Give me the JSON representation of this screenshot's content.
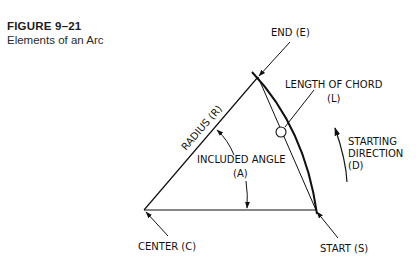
{
  "caption": {
    "figure_number": "FIGURE 9–21",
    "title": "Elements of an Arc"
  },
  "diagram": {
    "labels": {
      "end": "END (E)",
      "length_chord_1": "LENGTH OF CHORD",
      "length_chord_2": "(L)",
      "radius": "RADIUS (R)",
      "included_angle_1": "INCLUDED ANGLE",
      "included_angle_2": "(A)",
      "starting_dir_1": "STARTING",
      "starting_dir_2": "DIRECTION",
      "starting_dir_3": "(D)",
      "center": "CENTER (C)",
      "start": "START (S)"
    },
    "points": {
      "center": [
        144,
        210
      ],
      "end": [
        258,
        77
      ],
      "start": [
        316,
        210
      ]
    },
    "colors": {
      "line": "#111111",
      "text": "#111111"
    }
  }
}
